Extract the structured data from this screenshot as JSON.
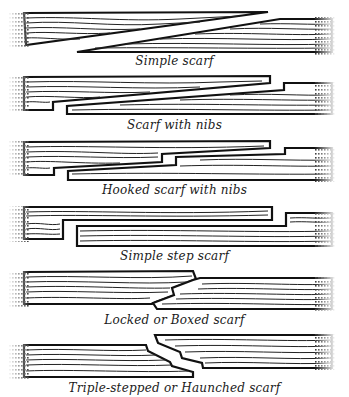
{
  "figure": {
    "panels": [
      {
        "id": "simple-scarf",
        "caption": "Simple scarf"
      },
      {
        "id": "scarf-with-nibs",
        "caption": "Scarf with nibs"
      },
      {
        "id": "hooked-scarf-with-nibs",
        "caption": "Hooked scarf with nibs"
      },
      {
        "id": "simple-step-scarf",
        "caption": "Simple step scarf"
      },
      {
        "id": "locked-or-boxed-scarf",
        "caption": "Locked or Boxed scarf"
      },
      {
        "id": "triple-stepped-or-haunched-scarf",
        "caption": "Triple-stepped or Haunched scarf"
      }
    ]
  },
  "colors": {
    "ink": "#111111",
    "background": "#ffffff"
  }
}
